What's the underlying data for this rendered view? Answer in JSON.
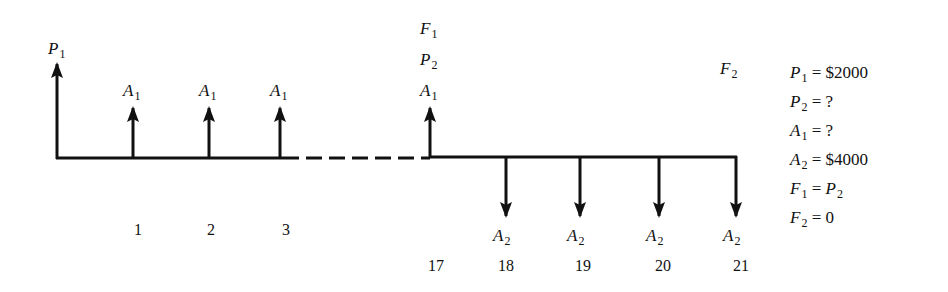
{
  "diagram": {
    "type": "cash-flow-diagram",
    "axis": {
      "y": 158,
      "x_start": 57,
      "x_end": 736,
      "dashed_from": 283,
      "dashed_to": 428
    },
    "upward_flows": [
      {
        "name": "P",
        "sub": "1",
        "x": 57,
        "top": 66
      },
      {
        "name": "A",
        "sub": "1",
        "x": 133,
        "top": 106,
        "period": "1"
      },
      {
        "name": "A",
        "sub": "1",
        "x": 209,
        "top": 106,
        "period": "2"
      },
      {
        "name": "A",
        "sub": "1",
        "x": 280,
        "top": 106,
        "period": "3"
      },
      {
        "name": "A",
        "sub": "1",
        "x": 430,
        "top": 106,
        "period": "17"
      }
    ],
    "stacked_labels_at_17": [
      {
        "name": "F",
        "sub": "1"
      },
      {
        "name": "P",
        "sub": "2"
      }
    ],
    "downward_flows": [
      {
        "name": "A",
        "sub": "2",
        "x": 506,
        "period": "18"
      },
      {
        "name": "A",
        "sub": "2",
        "x": 580,
        "period": "19"
      },
      {
        "name": "A",
        "sub": "2",
        "x": 659,
        "period": "20"
      },
      {
        "name": "A",
        "sub": "2",
        "x": 736,
        "period": "21"
      }
    ],
    "f2_label": {
      "name": "F",
      "sub": "2"
    },
    "periods_top": [
      "1",
      "2",
      "3"
    ],
    "periods_bottom": [
      "17",
      "18",
      "19",
      "20",
      "21"
    ],
    "given": [
      {
        "var": "P",
        "sub": "1",
        "eq": " = $2000"
      },
      {
        "var": "P",
        "sub": "2",
        "eq": " = ?"
      },
      {
        "var": "A",
        "sub": "1",
        "eq": " = ?"
      },
      {
        "var": "A",
        "sub": "2",
        "eq": " = $4000"
      },
      {
        "var": "F",
        "sub": "1",
        "eq": " = ",
        "rhs_var": "P",
        "rhs_sub": "2"
      },
      {
        "var": "F",
        "sub": "2",
        "eq": " = 0"
      }
    ]
  }
}
